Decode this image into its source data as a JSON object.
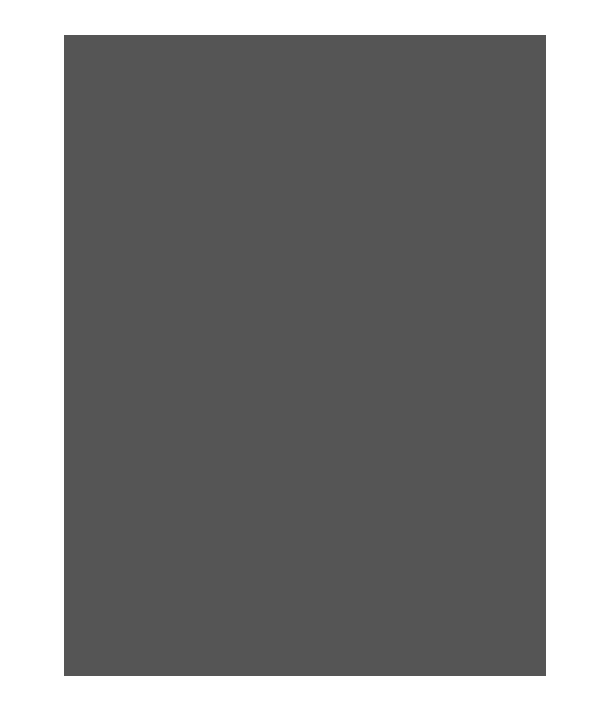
{
  "chart_data": {
    "type": "knitting-chart",
    "columns": 32,
    "rows": 44,
    "row_numbers_left": [
      44,
      42,
      40,
      38,
      36,
      34,
      32,
      30,
      28,
      26,
      24,
      22,
      20,
      18,
      16,
      14,
      12,
      10,
      8,
      6,
      4,
      2
    ],
    "row_numbers_right": [
      43,
      41,
      39,
      37,
      35,
      33,
      31,
      29,
      27,
      25,
      23,
      21,
      19,
      17,
      15,
      13,
      11,
      9,
      7,
      5,
      3,
      1
    ],
    "border": {
      "left_cols": 5,
      "right_cols": 5,
      "top_rows": 4,
      "bottom_rows": 4
    },
    "motif": {
      "name": "octagon",
      "shape": [
        [
          2,
          3
        ],
        [
          1,
          2,
          3,
          4
        ],
        [
          0,
          1,
          2,
          3,
          4,
          5
        ],
        [
          0,
          1,
          2,
          3,
          4,
          5
        ],
        [
          1,
          2,
          3,
          4
        ],
        [
          2,
          3
        ]
      ],
      "origin_cols": [
        6,
        13,
        20
      ],
      "origin_rows_from_top": [
        5,
        12,
        19,
        26,
        33
      ],
      "repeat": "3 across x 5 down"
    },
    "colors": {
      "background": "#ffffff",
      "border_cells": "#e4e4e4",
      "motif_cells": "#8c8c8c",
      "grid_lines": "#555555"
    }
  }
}
